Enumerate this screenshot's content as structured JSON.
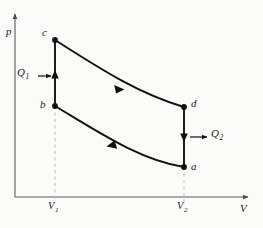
{
  "figure": {
    "type": "pv-diagram",
    "title": "",
    "background_color": "#fbfbf9",
    "line_color": "#111111",
    "dash_color": "#b9b9b9",
    "axes": {
      "y_label": "p",
      "x_label": "V",
      "origin": [
        15,
        197
      ],
      "y_axis_top": [
        15,
        12
      ],
      "x_axis_right": [
        250,
        197
      ]
    },
    "ticks": {
      "x": [
        {
          "label": "V",
          "sub": "1",
          "x": 55
        },
        {
          "label": "V",
          "sub": "2",
          "x": 184
        }
      ]
    },
    "nodes": [
      {
        "id": "c",
        "label": "c",
        "x": 55,
        "y": 40,
        "label_dx": -11,
        "label_dy": -12
      },
      {
        "id": "b",
        "label": "b",
        "x": 55,
        "y": 106,
        "label_dx": -13,
        "label_dy": -6
      },
      {
        "id": "d",
        "label": "d",
        "x": 184,
        "y": 107,
        "label_dx": 6,
        "label_dy": -12
      },
      {
        "id": "a",
        "label": "a",
        "x": 184,
        "y": 167,
        "label_dx": 6,
        "label_dy": -4
      }
    ],
    "paths": [
      {
        "id": "b-to-c",
        "from": "b",
        "to": "c",
        "kind": "isochoric",
        "direction": "up"
      },
      {
        "id": "c-to-d",
        "from": "c",
        "to": "d",
        "kind": "isothermal",
        "direction": "right"
      },
      {
        "id": "d-to-a",
        "from": "d",
        "to": "a",
        "kind": "isochoric",
        "direction": "down"
      },
      {
        "id": "a-to-b",
        "from": "a",
        "to": "b",
        "kind": "isothermal",
        "direction": "left"
      }
    ],
    "heat_flows": [
      {
        "id": "Q1",
        "label": "Q",
        "sub": "1",
        "label_x": 16,
        "label_y": 68,
        "arrow_from": [
          38,
          76
        ],
        "arrow_to": [
          52,
          76
        ],
        "sense": "into-system"
      },
      {
        "id": "Q2",
        "label": "Q",
        "sub": "2",
        "label_x": 213,
        "label_y": 130,
        "arrow_from": [
          189,
          137
        ],
        "arrow_to": [
          208,
          137
        ],
        "sense": "out-of-system"
      }
    ]
  }
}
